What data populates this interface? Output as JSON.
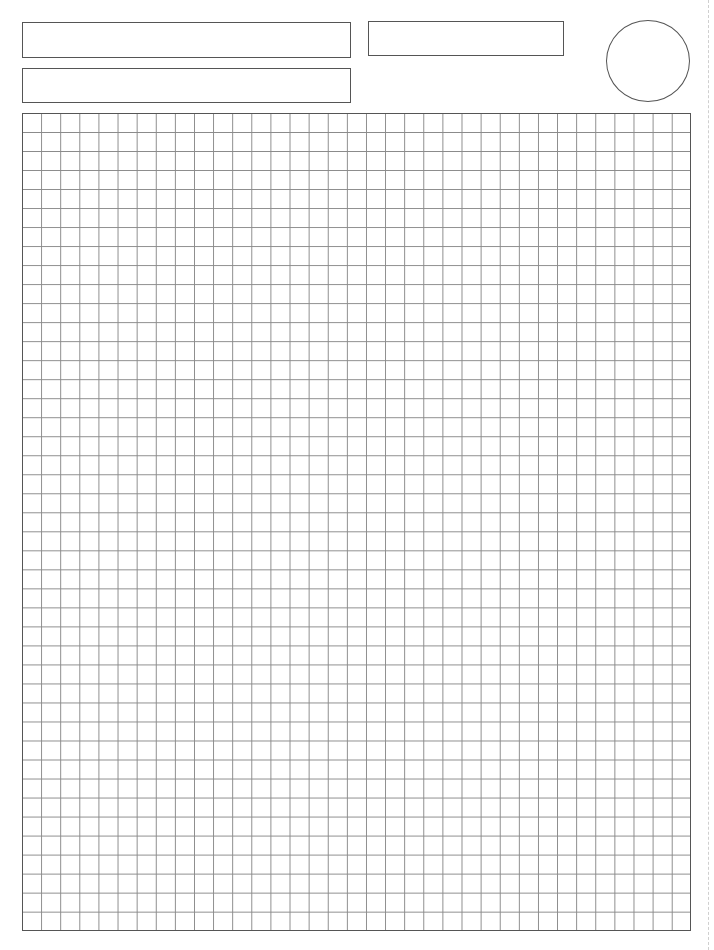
{
  "page": {
    "type": "graph-paper-worksheet",
    "background": "#ffffff",
    "line_color": "#555555"
  },
  "header": {
    "fields": [
      {
        "name": "field-1",
        "value": ""
      },
      {
        "name": "field-2",
        "value": ""
      },
      {
        "name": "field-3",
        "value": ""
      }
    ],
    "circle": {
      "value": ""
    }
  },
  "grid": {
    "columns": 35,
    "rows": 43,
    "cell_size_px": 19.1,
    "line_color": "#8a8a8a"
  }
}
